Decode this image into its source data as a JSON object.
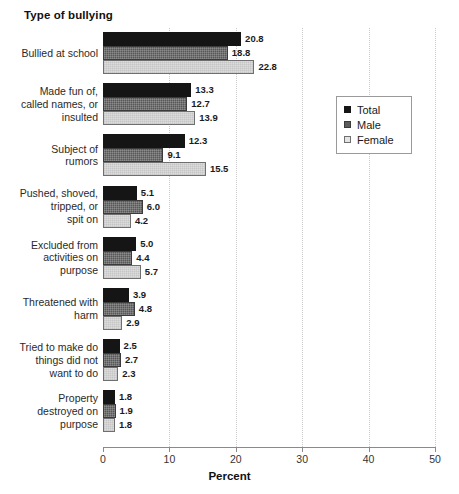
{
  "chart_data": {
    "type": "bar",
    "orientation": "horizontal",
    "title": "Type of bullying",
    "xlabel": "Percent",
    "ylabel": "",
    "xlim": [
      0,
      50
    ],
    "xticks": [
      0,
      10,
      20,
      30,
      40,
      50
    ],
    "xtick_labels": [
      "0",
      "10",
      "20",
      "30",
      "40",
      "50"
    ],
    "grid": "vertical-dotted",
    "legend_position": "right-upper",
    "categories": [
      "Bullied at school",
      "Made fun of,\ncalled names, or\ninsulted",
      "Subject of\nrumors",
      "Pushed, shoved,\ntripped, or\nspit on",
      "Excluded from\nactivities on\npurpose",
      "Threatened with\nharm",
      "Tried to make do\nthings did not\nwant to do",
      "Property\ndestroyed on\npurpose"
    ],
    "series": [
      {
        "name": "Total",
        "color": "#151515",
        "values": [
          20.8,
          13.3,
          12.3,
          5.1,
          5.0,
          3.9,
          2.5,
          1.8
        ],
        "labels": [
          "20.8",
          "13.3",
          "12.3",
          "5.1",
          "5.0",
          "3.9",
          "2.5",
          "1.8"
        ]
      },
      {
        "name": "Male",
        "color": "#575757",
        "values": [
          18.8,
          12.7,
          9.1,
          6.0,
          4.4,
          4.8,
          2.7,
          1.9
        ],
        "labels": [
          "18.8",
          "12.7",
          "9.1",
          "6.0",
          "4.4",
          "4.8",
          "2.7",
          "1.9"
        ]
      },
      {
        "name": "Female",
        "color": "#dcdcdc",
        "values": [
          22.8,
          13.9,
          15.5,
          4.2,
          5.7,
          2.9,
          2.3,
          1.8
        ],
        "labels": [
          "22.8",
          "13.9",
          "15.5",
          "4.2",
          "5.7",
          "2.9",
          "2.3",
          "1.8"
        ]
      }
    ]
  },
  "legend": {
    "entries": [
      {
        "label": "Total",
        "swatch": "total"
      },
      {
        "label": "Male",
        "swatch": "male"
      },
      {
        "label": "Female",
        "swatch": "female"
      }
    ]
  }
}
